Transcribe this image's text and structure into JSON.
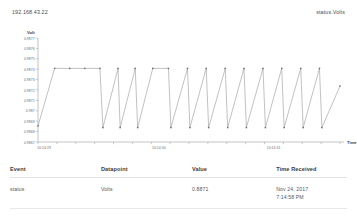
{
  "header": {
    "device_address": "192.168.43.22",
    "stream_name": "status.Volts"
  },
  "chart_data": {
    "type": "line",
    "title": "",
    "xlabel": "Time",
    "ylabel": "Volt",
    "grid": false,
    "legend": false,
    "ylim": [
      0.9865,
      0.9878
    ],
    "ytick_labels": [
      "0.9877",
      "0.9876",
      "0.9875",
      "0.9874",
      "0.9873",
      "0.9872",
      "0.9871",
      "0.987",
      "0.9869",
      "0.9868",
      "0.9867"
    ],
    "xtick_labels": [
      "10:14:29",
      "10:14:30",
      "10:14:31"
    ],
    "xaxis_end_label": "Time",
    "series": [
      {
        "name": "status.Volts",
        "points": [
          {
            "x": 0.0,
            "y": 0.9867
          },
          {
            "x": 0.055,
            "y": 0.98742
          },
          {
            "x": 0.105,
            "y": 0.98742
          },
          {
            "x": 0.155,
            "y": 0.98742
          },
          {
            "x": 0.205,
            "y": 0.98742
          },
          {
            "x": 0.215,
            "y": 0.98668
          },
          {
            "x": 0.265,
            "y": 0.98742
          },
          {
            "x": 0.272,
            "y": 0.98668
          },
          {
            "x": 0.322,
            "y": 0.98742
          },
          {
            "x": 0.33,
            "y": 0.98668
          },
          {
            "x": 0.38,
            "y": 0.98742
          },
          {
            "x": 0.432,
            "y": 0.98742
          },
          {
            "x": 0.44,
            "y": 0.98668
          },
          {
            "x": 0.495,
            "y": 0.98742
          },
          {
            "x": 0.503,
            "y": 0.98668
          },
          {
            "x": 0.557,
            "y": 0.98742
          },
          {
            "x": 0.565,
            "y": 0.98668
          },
          {
            "x": 0.62,
            "y": 0.98742
          },
          {
            "x": 0.628,
            "y": 0.98668
          },
          {
            "x": 0.682,
            "y": 0.98742
          },
          {
            "x": 0.69,
            "y": 0.98668
          },
          {
            "x": 0.745,
            "y": 0.98742
          },
          {
            "x": 0.753,
            "y": 0.98668
          },
          {
            "x": 0.807,
            "y": 0.98742
          },
          {
            "x": 0.815,
            "y": 0.98668
          },
          {
            "x": 0.87,
            "y": 0.98742
          },
          {
            "x": 0.878,
            "y": 0.98668
          },
          {
            "x": 0.932,
            "y": 0.98742
          },
          {
            "x": 0.94,
            "y": 0.98668
          },
          {
            "x": 1.0,
            "y": 0.9872
          }
        ]
      }
    ],
    "line_color": "#9a9a9a",
    "marker_color": "#6b6b6b",
    "axis_color": "#9b9b9b"
  },
  "events_table": {
    "columns": [
      "Event",
      "Datapoint",
      "Value",
      "Time Received"
    ],
    "rows": [
      {
        "event": "status",
        "datapoint": "Volts",
        "value": "0.8871",
        "time_date": "Nov 24, 2017",
        "time_clock": "7:14:58 PM"
      }
    ]
  },
  "colors": {
    "text": "#4a4a4a",
    "heading": "#3c3c3c",
    "rule": "#e3e3e3",
    "background": "#ffffff"
  }
}
